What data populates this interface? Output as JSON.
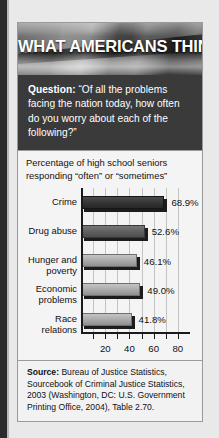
{
  "banner": {
    "title": "WHAT AMERICANS THINK"
  },
  "question": {
    "label": "Question:",
    "text": " “Of all the problems facing the nation today, how often do you worry about each of the following?”"
  },
  "source": {
    "label": "Source:",
    "text": " Bureau of Justice Statistics, Sourcebook of Criminal Justice Statistics, 2003 (Washington, DC: U.S. Government Printing Office, 2004), Table 2.70."
  },
  "chart_data": {
    "type": "bar",
    "orientation": "horizontal",
    "title": "Percentage of high school seniors responding “often” or “sometimes”",
    "xlabel": "",
    "ylabel": "",
    "xlim": [
      0,
      90
    ],
    "grid": true,
    "legend": false,
    "categories": [
      "Crime",
      "Drug abuse",
      "Hunger and\npoverty",
      "Economic\nproblems",
      "Race\nrelations"
    ],
    "values": [
      68.9,
      52.6,
      46.1,
      49.0,
      41.8
    ],
    "value_labels": [
      "68.9%",
      "52.6%",
      "46.1%",
      "49.0%",
      "41.8%"
    ],
    "bar_shades": [
      "dark",
      "mid",
      "light",
      "light",
      "light"
    ],
    "tick_values": [
      10,
      20,
      30,
      40,
      50,
      60,
      70,
      80
    ],
    "tick_labels": [
      "",
      "20",
      "",
      "40",
      "",
      "60",
      "",
      "80"
    ]
  }
}
